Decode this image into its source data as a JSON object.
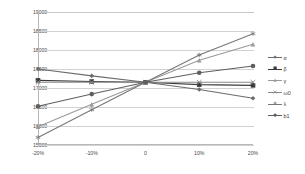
{
  "chart_data": {
    "type": "line",
    "title": "",
    "xlabel": "",
    "ylabel": "",
    "categories": [
      "-20%",
      "-10%",
      "0",
      "10%",
      "20%"
    ],
    "x_ticklabels": [
      "-20%",
      "-10%",
      "0",
      "10%",
      "20%"
    ],
    "y_ticklabels": [
      "19000",
      "18500",
      "18000",
      "17500",
      "17000",
      "16500",
      "16000",
      "15500"
    ],
    "ylim": [
      15500,
      19000
    ],
    "ytick_step": 500,
    "grid": true,
    "legend_position": "right",
    "series": [
      {
        "name": "α",
        "color": "#6b6b6b",
        "marker": "diamond",
        "values": [
          17500,
          17320,
          17150,
          16960,
          16730
        ]
      },
      {
        "name": "β",
        "color": "#3a3a3a",
        "marker": "square",
        "values": [
          17200,
          17170,
          17150,
          17090,
          17070
        ]
      },
      {
        "name": "γ",
        "color": "#9a9a9a",
        "marker": "triangle",
        "values": [
          15980,
          16570,
          17150,
          17730,
          18150
        ]
      },
      {
        "name": "ω0",
        "color": "#8a8a8a",
        "marker": "cross",
        "values": [
          17150,
          17150,
          17150,
          17150,
          17150
        ]
      },
      {
        "name": "λ",
        "color": "#777777",
        "marker": "star",
        "values": [
          15700,
          16430,
          17150,
          17870,
          18430
        ]
      },
      {
        "name": "b1",
        "color": "#5f5f5f",
        "marker": "circle",
        "values": [
          16520,
          16840,
          17150,
          17400,
          17580
        ]
      }
    ]
  },
  "axis": {
    "y_labels": [
      "19000",
      "18500",
      "18000",
      "17500",
      "17000",
      "16500",
      "16000",
      "15500"
    ],
    "x_labels": [
      "-20%",
      "-10%",
      "0",
      "10%",
      "20%"
    ]
  },
  "legend": {
    "items": [
      {
        "label": "α"
      },
      {
        "label": "β"
      },
      {
        "label": "γ"
      },
      {
        "label": "ω0"
      },
      {
        "label": "λ"
      },
      {
        "label": "b1"
      }
    ]
  }
}
